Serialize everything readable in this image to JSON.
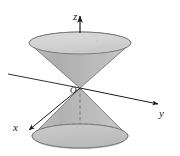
{
  "figure": {
    "background_color": "#ffffff",
    "labels": {
      "z_axis": "z",
      "y_axis": "y",
      "x_axis": "x",
      "origin": "O"
    },
    "colors": {
      "stroke": "#4a4a4a",
      "axis": "#1a1a1a",
      "cone_body_light": "#c9c9c9",
      "cone_body_mid": "#b4b4b4",
      "cone_body_dark": "#a0a0a0",
      "ellipse_top_fill": "#d6d6d6",
      "ellipse_bottom_fill": "#c4c4c4",
      "dashed": "#8a8a8a"
    },
    "geometry": {
      "origin_x": 80,
      "origin_y": 88,
      "upper_ellipse_center_y": 43,
      "upper_ellipse_rx": 51,
      "upper_ellipse_ry": 11,
      "lower_ellipse_center_y": 136,
      "lower_ellipse_rx": 48,
      "lower_ellipse_ry": 12,
      "z_axis_top_y": 14,
      "y_axis_end_x": 161,
      "y_axis_end_y": 106,
      "y_axis_back_x": 8,
      "y_axis_back_y": 74,
      "x_axis_end_x": 26,
      "x_axis_end_y": 132
    }
  }
}
